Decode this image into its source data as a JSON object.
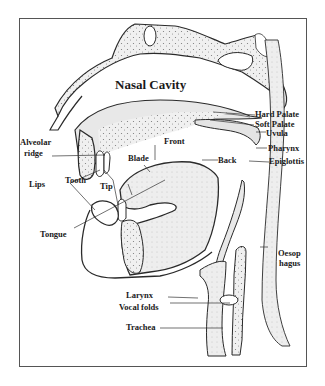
{
  "diagram": {
    "title": "Nasal Cavity",
    "colors": {
      "outline": "#2a2a2a",
      "tissue_fill": "#e9e9e9",
      "bone_fill": "#f2f2f2",
      "frame": "#555555"
    },
    "labels": {
      "nasal_cavity": "Nasal Cavity",
      "hard_palate": "Hard Palate",
      "soft_palate": "Soft Palate",
      "uvula": "Uvula",
      "pharynx": "Pharynx",
      "epiglottis": "Epiglottis",
      "alveolar_ridge_1": "Alveolar",
      "alveolar_ridge_2": "ridge",
      "front": "Front",
      "blade": "Blade",
      "back": "Back",
      "lips": "Lips",
      "tooth": "Tooth",
      "tip": "Tip",
      "tongue": "Tongue",
      "oesophagus_1": "Oesop",
      "oesophagus_2": "hagus",
      "larynx": "Larynx",
      "vocal_folds": "Vocal folds",
      "trachea": "Trachea"
    }
  }
}
